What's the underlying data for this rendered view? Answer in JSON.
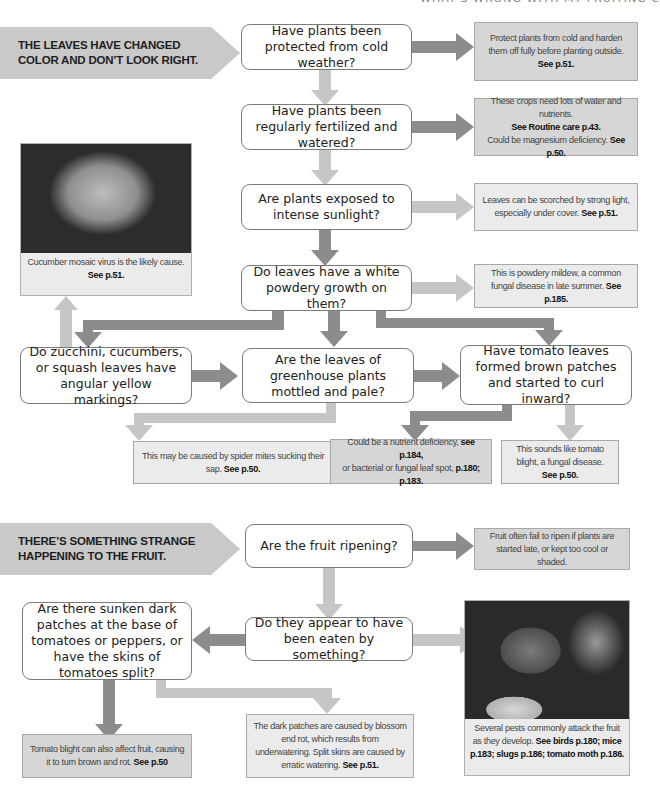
{
  "page_header": "WHAT'S WRONG WITH MY FRUITING CROPS?",
  "section1": {
    "banner": [
      "THE LEAVES HAVE CHANGED",
      "COLOR AND DON’T LOOK RIGHT."
    ],
    "questions": {
      "q1": "Have plants been protected from cold weather?",
      "q2": "Have plants been regularly fertilized and watered?",
      "q3": "Are plants exposed to intense sunlight?",
      "q4": "Do leaves have a white powdery growth on them?",
      "q5": "Do zucchini, cucumbers, or squash leaves have angular yellow markings?",
      "q6": "Are the leaves of greenhouse plants mottled and pale?",
      "q7": "Have tomato leaves formed brown patches and started to curl inward?"
    },
    "answers": {
      "a1": {
        "text": "Protect plants from cold and harden them off fully before planting outside.",
        "ref": "See p.51."
      },
      "a2": {
        "text": "These crops need lots of water and nutrients.",
        "ref": "See Routine care p.43.",
        "text2": "Could be magnesium deficiency.",
        "ref2": "See p.50."
      },
      "a3": {
        "text": "Leaves can be scorched by strong light, especially under cover.",
        "ref": "See p.51."
      },
      "a4": {
        "text": "This is powdery mildew, a common fungal disease in late summer.",
        "ref": "See p.185."
      },
      "a5": {
        "text": "Cucumber mosaic virus is the likely cause.",
        "ref": "See p.51."
      },
      "a6": {
        "text": "This may be caused by spider mites sucking their sap.",
        "ref": "See p.50."
      },
      "a7": {
        "text": "Could be a nutrient deficiency,",
        "ref": "see p.184,",
        "text2": "or bacterial or fungal leaf spot,",
        "ref2": "p.180; p.183."
      },
      "a8": {
        "text": "This sounds like tomato blight, a fungal disease.",
        "ref": "See p.50."
      }
    }
  },
  "section2": {
    "banner": [
      "THERE’S SOMETHING STRANGE",
      "HAPPENING TO THE FRUIT."
    ],
    "questions": {
      "q1": "Are the fruit ripening?",
      "q2": "Do they appear to have been eaten by something?",
      "q3": "Are there sunken dark patches at the base of tomatoes or peppers, or have the skins of tomatoes split?"
    },
    "answers": {
      "a1": {
        "text": "Fruit often fail to ripen if plants are started late, or kept too cool or shaded."
      },
      "a2": {
        "text": "Several pests commonly attack the fruit as they develop.",
        "ref": "See birds p.180;  mice p.183; slugs p.186; tomato moth p.186."
      },
      "a3": {
        "text": "Tomato blight can also affect fruit, causing it to turn brown and rot.",
        "ref": "See p.50"
      },
      "a4": {
        "text": "The dark patches are caused by blossom end rot, which results from underwatering. Split skins are caused by erratic watering.",
        "ref": "See p.51."
      }
    }
  },
  "colors": {
    "dark_arrow": "#8c8c8c",
    "light_arrow": "#c6c6c6",
    "dark_box": "#d6d6d6",
    "light_box": "#ebebeb",
    "banner": "#c9c9c9"
  },
  "images": {
    "leaf_photo": "leaf-mosaic-photo",
    "slug_photo": "slug-photo"
  }
}
